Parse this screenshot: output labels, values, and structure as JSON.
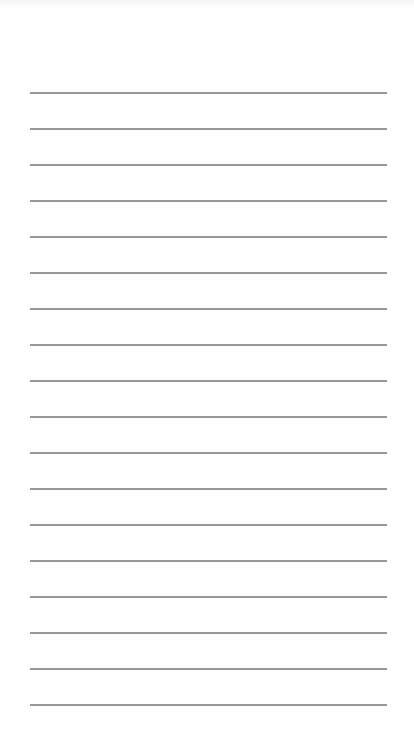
{
  "notepad": {
    "line_color": "#8c8c8c",
    "background_color": "#ffffff",
    "line_left": 30,
    "line_width": 357,
    "first_line_y": 92,
    "line_spacing": 36,
    "line_count": 18,
    "lines": [
      "",
      "",
      "",
      "",
      "",
      "",
      "",
      "",
      "",
      "",
      "",
      "",
      "",
      "",
      "",
      "",
      "",
      ""
    ]
  }
}
